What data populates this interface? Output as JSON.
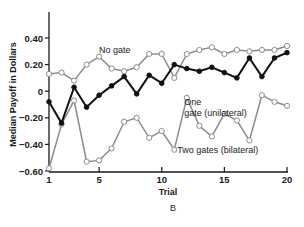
{
  "chart_data": {
    "type": "line",
    "title": "",
    "panel_label": "B",
    "xlabel": "Trial",
    "ylabel": "Median Payoff in Dollars",
    "xlim": [
      1,
      20
    ],
    "ylim": [
      -0.6,
      0.4
    ],
    "x_ticks": [
      1,
      5,
      10,
      15,
      20
    ],
    "x_tick_labels": [
      "1",
      "5",
      "10",
      "15",
      "20"
    ],
    "y_ticks": [
      0.4,
      0.2,
      0,
      -0.2,
      -0.4,
      -0.6
    ],
    "y_tick_labels": [
      "0.40",
      "0.20",
      "0",
      "−0.20",
      "−0.40",
      "−0.60"
    ],
    "grid": false,
    "legend": "inline annotations",
    "x": [
      1,
      2,
      3,
      4,
      5,
      6,
      7,
      8,
      9,
      10,
      11,
      12,
      13,
      14,
      15,
      16,
      17,
      18,
      19,
      20
    ],
    "series": [
      {
        "name": "No gate",
        "marker": "open-circle",
        "color": "#8c8c8c",
        "values": [
          0.13,
          0.14,
          0.08,
          0.2,
          0.26,
          0.17,
          0.15,
          0.18,
          0.28,
          0.28,
          0.1,
          0.28,
          0.31,
          0.33,
          0.28,
          0.31,
          0.3,
          0.31,
          0.31,
          0.34
        ]
      },
      {
        "name": "One gate (unilateral)",
        "marker": "filled-circle",
        "color": "#111111",
        "values": [
          -0.08,
          -0.24,
          0.03,
          -0.12,
          -0.03,
          0.04,
          0.11,
          -0.02,
          0.12,
          0.06,
          0.2,
          0.17,
          0.15,
          0.18,
          0.14,
          0.1,
          0.25,
          0.11,
          0.25,
          0.29
        ]
      },
      {
        "name": "Two gates (bilateral)",
        "marker": "open-circle",
        "color": "#8c8c8c",
        "values": [
          -0.58,
          -0.25,
          -0.07,
          -0.53,
          -0.52,
          -0.43,
          -0.23,
          -0.2,
          -0.35,
          -0.3,
          -0.44,
          -0.05,
          -0.26,
          -0.34,
          -0.17,
          -0.22,
          -0.37,
          -0.03,
          -0.08,
          -0.11
        ]
      }
    ],
    "annotations": [
      {
        "text": "No gate",
        "series": 0
      },
      {
        "text": "One",
        "series": 1
      },
      {
        "text": "gate (unilateral)",
        "series": 1
      },
      {
        "text": "Two gates (bilateral)",
        "series": 2
      }
    ]
  }
}
